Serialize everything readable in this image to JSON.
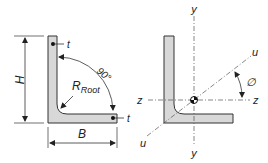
{
  "left_diagram": {
    "height_label": "H",
    "width_label": "B",
    "thickness_top_label": "t",
    "thickness_right_label": "t",
    "angle_label": "90°",
    "root_radius_label": "R",
    "root_radius_subscript": "Root"
  },
  "right_diagram": {
    "y_axis_top": "y",
    "y_axis_bottom": "y",
    "z_axis_left": "z",
    "z_axis_right": "z",
    "u_axis_top": "u",
    "u_axis_bottom": "u",
    "angle_label": "∅"
  },
  "colors": {
    "section_fill": "#d8d8d8",
    "outline": "#333333"
  }
}
